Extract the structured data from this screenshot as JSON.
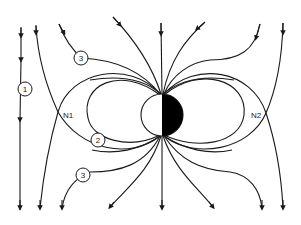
{
  "diagram": {
    "title": "",
    "colors": {
      "line": "#1a1a1a",
      "background": "#ffffff",
      "sphere_dark": "#000000",
      "sphere_light": "#ffffff"
    },
    "labels": {
      "line_1": "1",
      "line_2": "2",
      "line_3_top": "3",
      "line_3_bottom": "3",
      "neutral_point_left": "N1",
      "neutral_point_right": "N2"
    },
    "sphere": {
      "cx": 162,
      "cy": 115,
      "r": 21,
      "left_half": "white",
      "right_half": "black"
    },
    "arrow_direction": "downward"
  }
}
